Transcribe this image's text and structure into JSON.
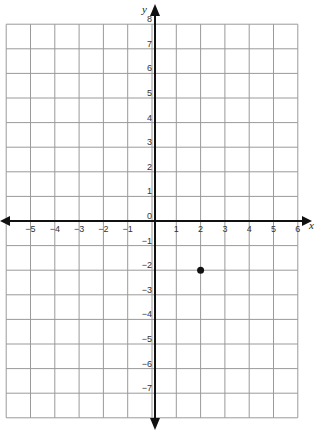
{
  "header": {
    "text": ""
  },
  "chart_data": {
    "type": "scatter",
    "title": "",
    "xlabel": "x",
    "ylabel": "y",
    "xlim": [
      -6,
      6
    ],
    "ylim": [
      -8,
      8
    ],
    "grid": true,
    "x_ticks": [
      -5,
      -4,
      -3,
      -2,
      -1,
      1,
      2,
      3,
      4,
      5,
      6
    ],
    "y_ticks": [
      8,
      7,
      6,
      5,
      4,
      3,
      2,
      1,
      -1,
      -2,
      -3,
      -4,
      -5,
      -6,
      -7
    ],
    "origin_label": "0",
    "points": [
      {
        "x": 2,
        "y": -2
      }
    ]
  },
  "colors": {
    "grid": "#9a9a9a",
    "axis": "#111111",
    "point": "#111111"
  }
}
